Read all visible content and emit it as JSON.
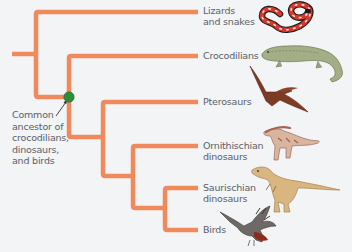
{
  "diagram": {
    "type": "phylogenetic-tree",
    "line_color": "#f08a5d",
    "node_color": "#2e8b3a",
    "caption": "Common\nancestor of\ncrocodilians,\ndinosaurs,\nand birds",
    "taxa": [
      {
        "id": "lizards",
        "label": "Lizards\nand snakes",
        "illustration": "coral-snake-illustration"
      },
      {
        "id": "crocodilians",
        "label": "Crocodilians",
        "illustration": "crocodile-illustration"
      },
      {
        "id": "pterosaurs",
        "label": "Pterosaurs",
        "illustration": "pterosaur-illustration"
      },
      {
        "id": "ornithischian",
        "label": "Ornithischian\ndinosaurs",
        "illustration": "parasaurolophus-illustration"
      },
      {
        "id": "saurischian",
        "label": "Saurischian\ndinosaurs",
        "illustration": "theropod-illustration"
      },
      {
        "id": "birds",
        "label": "Birds",
        "illustration": "bird-illustration"
      }
    ],
    "tree": "(Lizards and snakes, (Crocodilians, (Pterosaurs, (Ornithischian dinosaurs, (Saurischian dinosaurs, Birds)))))",
    "highlighted_node": "Common ancestor of crocodilians, dinosaurs, and birds"
  }
}
